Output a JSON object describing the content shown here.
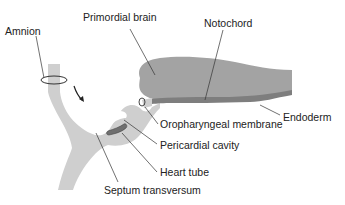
{
  "diagram": {
    "type": "embryo-sagittal-section",
    "colors": {
      "background": "#ffffff",
      "light_tissue": "#cfcfcf",
      "brain": "#a3a3a3",
      "notochord_endoderm": "#7e7e7e",
      "heart_tube": "#6f6f6f",
      "outline": "#555555",
      "leader_line": "#333333",
      "text": "#222222"
    },
    "labels": {
      "amnion": "Amnion",
      "primordial_brain": "Primordial brain",
      "notochord": "Notochord",
      "endoderm": "Endoderm",
      "oropharyngeal_membrane": "Oropharyngeal membrane",
      "pericardial_cavity": "Pericardial cavity",
      "heart_tube": "Heart tube",
      "septum_transversum": "Septum transversum"
    }
  }
}
